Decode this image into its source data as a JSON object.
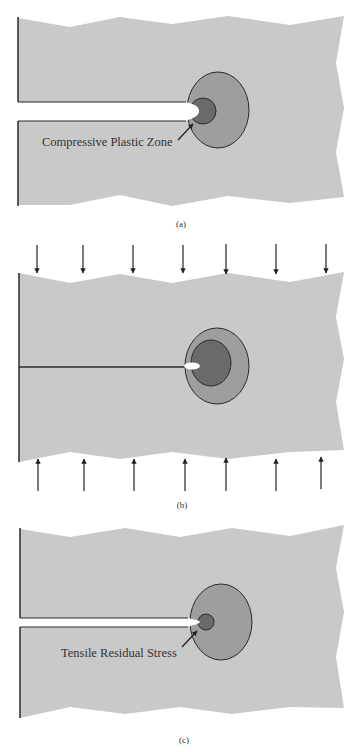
{
  "figure": {
    "panels": [
      {
        "id": "a",
        "caption": "(a)",
        "annotation": "Compressive Plastic Zone",
        "crack_state": "open"
      },
      {
        "id": "b",
        "caption": "(b)",
        "annotation": "",
        "crack_state": "closed under compressive load",
        "load_arrows_top": 7,
        "load_arrows_bottom": 7
      },
      {
        "id": "c",
        "caption": "(c)",
        "annotation": "Tensile Residual Stress",
        "crack_state": "open"
      }
    ],
    "colors": {
      "plate": "#c9c9c9",
      "outer_zone": "#9e9e9e",
      "inner_zone": "#6a6a6a",
      "outline": "#2a2a2a",
      "crack": "#ffffff",
      "background": "#ffffff"
    }
  }
}
